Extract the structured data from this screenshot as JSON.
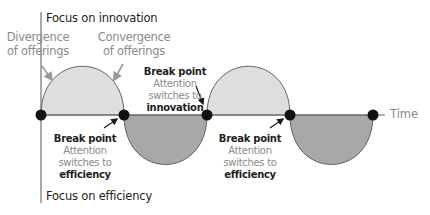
{
  "diagram": {
    "top_axis_label": "Focus on innovation",
    "bottom_axis_label": "Focus on efficiency",
    "time_label": "Time",
    "phase_labels": {
      "divergence": [
        "Divergence",
        "of offerings"
      ],
      "convergence": [
        "Convergence",
        "of offerings"
      ]
    },
    "break_points": [
      {
        "title": "Break point",
        "line1": "Attention",
        "line2": "switches to",
        "target": "efficiency"
      },
      {
        "title": "Break point",
        "line1": "Attention",
        "line2": "switches to",
        "target": "innovation"
      },
      {
        "title": "Break point",
        "line1": "Attention",
        "line2": "switches to",
        "target": "efficiency"
      }
    ],
    "colors": {
      "innovation_fill": "#dedede",
      "efficiency_fill": "#a8a8a8",
      "outline": "#555555",
      "dot": "#111111",
      "label_grey": "#8a8a8a"
    },
    "cycle": {
      "node_x": [
        41,
        124,
        207,
        290,
        373
      ],
      "baseline_y": 115,
      "amplitude": 50,
      "arches": [
        "innovation",
        "efficiency",
        "innovation",
        "efficiency"
      ]
    }
  }
}
